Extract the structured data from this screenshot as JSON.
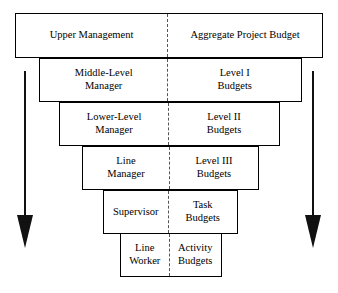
{
  "diagram": {
    "divider_style": "dashed",
    "border_color": "#000000",
    "background_color": "#ffffff",
    "rows": [
      {
        "id": "row-1",
        "left_label": "Upper Management",
        "right_label": "Aggregate Project Budget",
        "geometry": {
          "x": 15,
          "y": 13,
          "width": 308,
          "height": 45,
          "split": 0.497
        }
      },
      {
        "id": "row-2",
        "left_label": "Middle-Level\nManager",
        "right_label": "Level I\nBudgets",
        "geometry": {
          "x": 39,
          "y": 58,
          "width": 263,
          "height": 44,
          "split": 0.492
        }
      },
      {
        "id": "row-3",
        "left_label": "Lower-Level\nManager",
        "right_label": "Level II\nBudgets",
        "geometry": {
          "x": 59,
          "y": 102,
          "width": 221,
          "height": 44,
          "split": 0.498
        }
      },
      {
        "id": "row-4",
        "left_label": "Line\nManager",
        "right_label": "Level III\nBudgets",
        "geometry": {
          "x": 82,
          "y": 146,
          "width": 177,
          "height": 44,
          "split": 0.497
        }
      },
      {
        "id": "row-5",
        "left_label": "Supervisor",
        "right_label": "Task\nBudgets",
        "geometry": {
          "x": 103,
          "y": 190,
          "width": 135,
          "height": 44,
          "split": 0.485
        }
      },
      {
        "id": "row-6",
        "left_label": "Line\nWorker",
        "right_label": "Activity\nBudgets",
        "geometry": {
          "x": 120,
          "y": 233,
          "width": 102,
          "height": 44,
          "split": 0.485
        }
      }
    ],
    "arrows": [
      {
        "id": "left-arrow",
        "name": "downward-flow-arrow-left",
        "direction": "down",
        "color": "#111111",
        "x": 25,
        "y_start": 71,
        "y_end": 248,
        "shaft_width": 2,
        "head_width": 17,
        "head_height": 33
      },
      {
        "id": "right-arrow",
        "name": "downward-flow-arrow-right",
        "direction": "down",
        "color": "#111111",
        "x": 313,
        "y_start": 71,
        "y_end": 248,
        "shaft_width": 2,
        "head_width": 17,
        "head_height": 33
      }
    ]
  }
}
